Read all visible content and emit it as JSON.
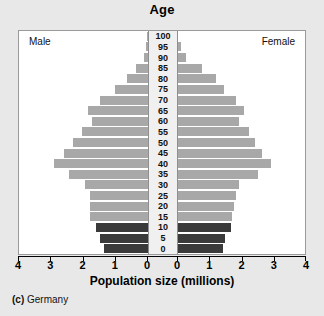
{
  "figure": {
    "title": "Age",
    "x_axis_title": "Population size (millions)",
    "caption_index": "(c)",
    "caption_label": "Germany",
    "male_label": "Male",
    "female_label": "Female",
    "colors": {
      "bar_light": "#a8a8a8",
      "bar_dark": "#3a3a3a",
      "background": "#e8e8e8",
      "plot_background": "#ffffff",
      "axis_strip": "#f0f0f0",
      "axis_line": "#000000"
    }
  },
  "x_ticks_left": [
    "4",
    "3",
    "2",
    "1",
    "0"
  ],
  "x_ticks_right": [
    "0",
    "1",
    "2",
    "3",
    "4"
  ],
  "chart_data": {
    "type": "bar",
    "subtype": "population-pyramid",
    "title": "Age",
    "subtitle": "(c) Germany",
    "xlabel": "Population size (millions)",
    "ylabel": "Age",
    "xlim": [
      0,
      4
    ],
    "xtick_values": [
      0,
      1,
      2,
      3,
      4
    ],
    "grid": false,
    "legend": [
      "Male",
      "Female"
    ],
    "legend_position": "inside-top-corners",
    "orientation": "horizontal-mirrored",
    "categories": [
      "100",
      "95",
      "90",
      "85",
      "80",
      "75",
      "70",
      "65",
      "60",
      "55",
      "50",
      "45",
      "40",
      "35",
      "30",
      "25",
      "20",
      "15",
      "10",
      "5",
      "0"
    ],
    "series": [
      {
        "name": "Male",
        "side": "left",
        "values": [
          0.03,
          0.07,
          0.13,
          0.37,
          0.65,
          1.02,
          1.5,
          1.87,
          1.75,
          2.05,
          2.32,
          2.62,
          2.92,
          2.45,
          1.95,
          1.8,
          1.8,
          1.8,
          1.62,
          1.5,
          1.35
        ]
      },
      {
        "name": "Female",
        "side": "right",
        "values": [
          0.06,
          0.17,
          0.32,
          0.8,
          1.25,
          1.5,
          1.85,
          2.1,
          1.95,
          2.25,
          2.45,
          2.67,
          2.95,
          2.55,
          1.95,
          1.87,
          1.8,
          1.75,
          1.7,
          1.52,
          1.45
        ]
      }
    ],
    "bar_colors": [
      "#a8a8a8",
      "#a8a8a8",
      "#a8a8a8",
      "#a8a8a8",
      "#a8a8a8",
      "#a8a8a8",
      "#a8a8a8",
      "#a8a8a8",
      "#a8a8a8",
      "#a8a8a8",
      "#a8a8a8",
      "#a8a8a8",
      "#a8a8a8",
      "#a8a8a8",
      "#a8a8a8",
      "#a8a8a8",
      "#a8a8a8",
      "#a8a8a8",
      "#3a3a3a",
      "#3a3a3a",
      "#3a3a3a"
    ]
  }
}
